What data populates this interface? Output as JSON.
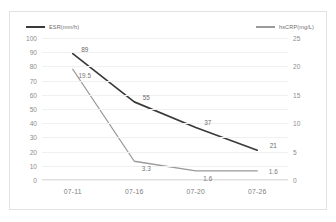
{
  "chart_data": {
    "type": "line",
    "title": "",
    "xlabel": "",
    "ylabel": "",
    "grid": true,
    "legend_position": "top",
    "categories": [
      "07-11",
      "07-16",
      "07-20",
      "07-26"
    ],
    "series": [
      {
        "name": "ESR(mm/h)",
        "axis": "left",
        "color": "#3a3a3a",
        "values": [
          89,
          55,
          37,
          21
        ],
        "labels": [
          "89",
          "55",
          "37",
          "21"
        ]
      },
      {
        "name": "hsCRP(mg/L)",
        "axis": "right",
        "color": "#9a9a9a",
        "values": [
          19.5,
          3.3,
          1.6,
          1.6
        ],
        "labels": [
          "19.5",
          "3.3",
          "1.6",
          "1.6"
        ]
      }
    ],
    "axes": {
      "left": {
        "min": 0,
        "max": 100,
        "step": 10,
        "ticks": [
          "100",
          "90",
          "80",
          "70",
          "60",
          "50",
          "40",
          "30",
          "20",
          "10",
          "0"
        ]
      },
      "right": {
        "min": 0,
        "max": 25,
        "step": 5,
        "ticks": [
          "25",
          "20",
          "15",
          "10",
          "5",
          "0"
        ]
      }
    }
  },
  "legend": {
    "esr": "ESR(mm/h)",
    "hscrp": "hsCRP(mg/L)"
  }
}
